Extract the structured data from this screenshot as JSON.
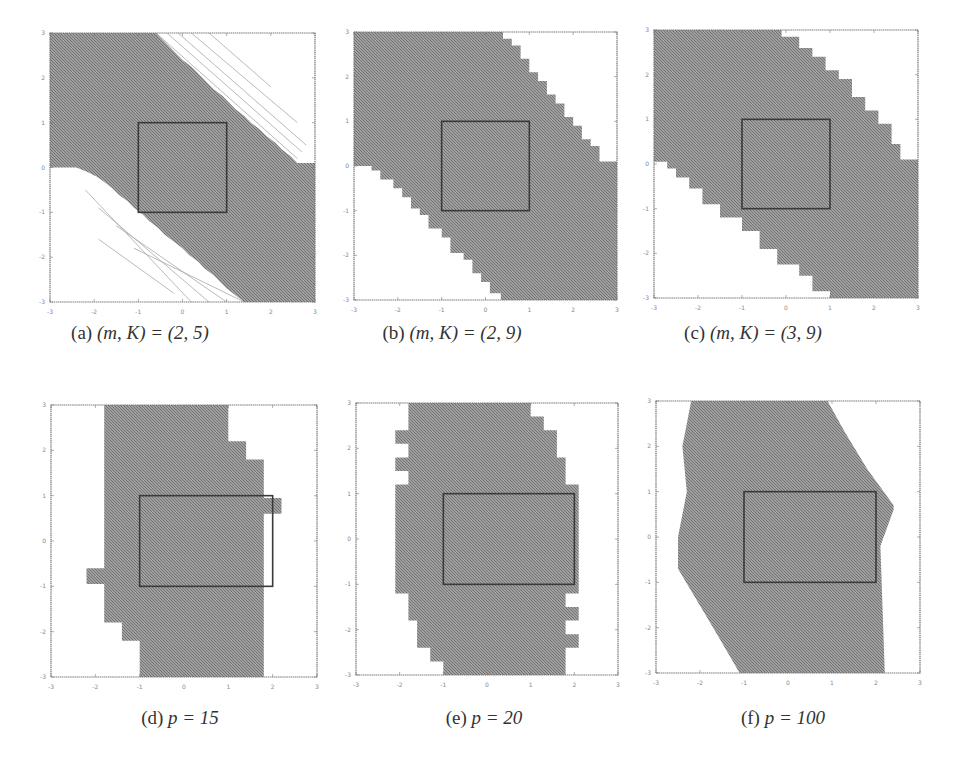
{
  "figure": {
    "panels": [
      {
        "id": "a",
        "caption_label": "(a)",
        "caption_math": "(m, K) = (2, 5)",
        "plot_box_px": [
          50,
          33,
          265,
          269
        ],
        "caption_pos_px": [
          140,
          334
        ],
        "region": [
          [
            -3,
            3
          ],
          [
            -0.6,
            3
          ],
          [
            -0.45,
            2.85
          ],
          [
            -0.3,
            2.7
          ],
          [
            -0.15,
            2.55
          ],
          [
            0,
            2.4
          ],
          [
            0.2,
            2.25
          ],
          [
            0.35,
            2.1
          ],
          [
            0.55,
            1.9
          ],
          [
            0.7,
            1.75
          ],
          [
            0.9,
            1.6
          ],
          [
            1.05,
            1.45
          ],
          [
            1.2,
            1.3
          ],
          [
            1.4,
            1.15
          ],
          [
            1.55,
            1.0
          ],
          [
            1.75,
            0.85
          ],
          [
            1.9,
            0.7
          ],
          [
            2.1,
            0.55
          ],
          [
            2.25,
            0.4
          ],
          [
            2.45,
            0.25
          ],
          [
            2.6,
            0.1
          ],
          [
            3,
            0.1
          ],
          [
            3,
            -3
          ],
          [
            1.4,
            -3
          ],
          [
            1.2,
            -2.85
          ],
          [
            1.0,
            -2.7
          ],
          [
            0.85,
            -2.55
          ],
          [
            0.7,
            -2.4
          ],
          [
            0.5,
            -2.25
          ],
          [
            0.35,
            -2.1
          ],
          [
            0.15,
            -1.95
          ],
          [
            0,
            -1.8
          ],
          [
            -0.2,
            -1.65
          ],
          [
            -0.4,
            -1.5
          ],
          [
            -0.55,
            -1.35
          ],
          [
            -0.75,
            -1.2
          ],
          [
            -0.9,
            -1.05
          ],
          [
            -1.1,
            -0.9
          ],
          [
            -1.25,
            -0.75
          ],
          [
            -1.45,
            -0.6
          ],
          [
            -1.6,
            -0.45
          ],
          [
            -1.8,
            -0.3
          ],
          [
            -1.95,
            -0.2
          ],
          [
            -2.15,
            -0.1
          ],
          [
            -2.4,
            0
          ],
          [
            -3,
            0
          ]
        ],
        "hatch_lines": [
          [
            [
              -0.6,
              3
            ],
            [
              2.6,
              0.2
            ]
          ],
          [
            [
              -0.35,
              3
            ],
            [
              2.7,
              0.35
            ]
          ],
          [
            [
              -0.1,
              3
            ],
            [
              2.8,
              0.5
            ]
          ],
          [
            [
              0.2,
              3
            ],
            [
              2.6,
              1.0
            ]
          ],
          [
            [
              0.6,
              3
            ],
            [
              2.0,
              1.8
            ]
          ],
          [
            [
              -1.1,
              -1.8
            ],
            [
              1.4,
              -3
            ]
          ],
          [
            [
              -1.5,
              -1.3
            ],
            [
              1.0,
              -3
            ]
          ],
          [
            [
              -1.9,
              -0.9
            ],
            [
              0.6,
              -3
            ]
          ],
          [
            [
              -2.2,
              -0.5
            ],
            [
              0.2,
              -3
            ]
          ],
          [
            [
              -1.9,
              -1.6
            ],
            [
              -0.2,
              -2.8
            ]
          ]
        ],
        "box": [
          [
            -1,
            -1
          ],
          [
            1,
            1
          ]
        ]
      },
      {
        "id": "b",
        "caption_label": "(b)",
        "caption_math": "(m, K) = (2, 9)",
        "plot_box_px": [
          354,
          32,
          263,
          268
        ],
        "caption_pos_px": [
          452,
          334
        ],
        "region": [
          [
            -3,
            3
          ],
          [
            0.4,
            3
          ],
          [
            0.4,
            2.85
          ],
          [
            0.6,
            2.85
          ],
          [
            0.6,
            2.7
          ],
          [
            0.8,
            2.7
          ],
          [
            0.8,
            2.4
          ],
          [
            1.0,
            2.4
          ],
          [
            1.0,
            2.1
          ],
          [
            1.2,
            2.1
          ],
          [
            1.2,
            1.9
          ],
          [
            1.4,
            1.9
          ],
          [
            1.4,
            1.6
          ],
          [
            1.6,
            1.6
          ],
          [
            1.6,
            1.4
          ],
          [
            1.8,
            1.4
          ],
          [
            1.8,
            1.1
          ],
          [
            2.0,
            1.1
          ],
          [
            2.0,
            0.9
          ],
          [
            2.2,
            0.9
          ],
          [
            2.2,
            0.6
          ],
          [
            2.4,
            0.6
          ],
          [
            2.4,
            0.45
          ],
          [
            2.6,
            0.45
          ],
          [
            2.6,
            0.1
          ],
          [
            3,
            0.1
          ],
          [
            3,
            -3
          ],
          [
            0.35,
            -3
          ],
          [
            0.35,
            -2.85
          ],
          [
            0.1,
            -2.85
          ],
          [
            0.1,
            -2.6
          ],
          [
            -0.1,
            -2.6
          ],
          [
            -0.1,
            -2.4
          ],
          [
            -0.3,
            -2.4
          ],
          [
            -0.3,
            -2.1
          ],
          [
            -0.5,
            -2.1
          ],
          [
            -0.5,
            -1.95
          ],
          [
            -0.8,
            -1.95
          ],
          [
            -0.8,
            -1.6
          ],
          [
            -1.0,
            -1.6
          ],
          [
            -1.0,
            -1.4
          ],
          [
            -1.3,
            -1.4
          ],
          [
            -1.3,
            -1.1
          ],
          [
            -1.5,
            -1.1
          ],
          [
            -1.5,
            -0.95
          ],
          [
            -1.7,
            -0.95
          ],
          [
            -1.7,
            -0.7
          ],
          [
            -1.9,
            -0.7
          ],
          [
            -1.9,
            -0.5
          ],
          [
            -2.1,
            -0.5
          ],
          [
            -2.1,
            -0.3
          ],
          [
            -2.4,
            -0.3
          ],
          [
            -2.4,
            -0.1
          ],
          [
            -2.6,
            -0.1
          ],
          [
            -2.6,
            0
          ],
          [
            -3,
            0
          ]
        ],
        "hatch_lines": [],
        "box": [
          [
            -1,
            -1
          ],
          [
            1,
            1
          ]
        ]
      },
      {
        "id": "c",
        "caption_label": "(c)",
        "caption_math": "(m, K) = (3, 9)",
        "plot_box_px": [
          654,
          30,
          264,
          268
        ],
        "caption_pos_px": [
          753,
          334
        ],
        "region": [
          [
            -3,
            3
          ],
          [
            -0.1,
            3
          ],
          [
            -0.1,
            2.85
          ],
          [
            0.3,
            2.85
          ],
          [
            0.3,
            2.6
          ],
          [
            0.6,
            2.6
          ],
          [
            0.6,
            2.4
          ],
          [
            0.9,
            2.4
          ],
          [
            0.9,
            2.1
          ],
          [
            1.2,
            2.1
          ],
          [
            1.2,
            1.9
          ],
          [
            1.5,
            1.9
          ],
          [
            1.5,
            1.5
          ],
          [
            1.8,
            1.5
          ],
          [
            1.8,
            1.2
          ],
          [
            2.1,
            1.2
          ],
          [
            2.1,
            0.9
          ],
          [
            2.4,
            0.9
          ],
          [
            2.4,
            0.45
          ],
          [
            2.6,
            0.45
          ],
          [
            2.6,
            0.1
          ],
          [
            3,
            0.1
          ],
          [
            3,
            -3
          ],
          [
            1.0,
            -3
          ],
          [
            1.0,
            -2.85
          ],
          [
            0.6,
            -2.85
          ],
          [
            0.6,
            -2.5
          ],
          [
            0.3,
            -2.5
          ],
          [
            0.3,
            -2.25
          ],
          [
            -0.2,
            -2.25
          ],
          [
            -0.2,
            -1.9
          ],
          [
            -0.6,
            -1.9
          ],
          [
            -0.6,
            -1.5
          ],
          [
            -1.0,
            -1.5
          ],
          [
            -1.0,
            -1.2
          ],
          [
            -1.5,
            -1.2
          ],
          [
            -1.5,
            -0.9
          ],
          [
            -1.9,
            -0.9
          ],
          [
            -1.9,
            -0.55
          ],
          [
            -2.2,
            -0.55
          ],
          [
            -2.2,
            -0.3
          ],
          [
            -2.5,
            -0.3
          ],
          [
            -2.5,
            -0.1
          ],
          [
            -2.7,
            -0.1
          ],
          [
            -2.7,
            0.05
          ],
          [
            -3,
            0.05
          ]
        ],
        "hatch_lines": [],
        "box": [
          [
            -1,
            -1
          ],
          [
            1,
            1
          ]
        ]
      },
      {
        "id": "d",
        "caption_label": "(d)",
        "caption_math": "p = 15",
        "plot_box_px": [
          51,
          405,
          266,
          272
        ],
        "caption_pos_px": [
          180,
          719
        ],
        "region": [
          [
            -1.8,
            3
          ],
          [
            1.0,
            3
          ],
          [
            1.0,
            2.2
          ],
          [
            1.4,
            2.2
          ],
          [
            1.4,
            1.8
          ],
          [
            1.8,
            1.8
          ],
          [
            1.8,
            0.95
          ],
          [
            2.2,
            0.95
          ],
          [
            2.2,
            0.6
          ],
          [
            1.8,
            0.6
          ],
          [
            1.8,
            -3
          ],
          [
            -1.0,
            -3
          ],
          [
            -1.0,
            -2.2
          ],
          [
            -1.4,
            -2.2
          ],
          [
            -1.4,
            -1.8
          ],
          [
            -1.8,
            -1.8
          ],
          [
            -1.8,
            -0.95
          ],
          [
            -2.2,
            -0.95
          ],
          [
            -2.2,
            -0.6
          ],
          [
            -1.8,
            -0.6
          ]
        ],
        "hatch_lines": [],
        "box": [
          [
            -1,
            -1
          ],
          [
            2,
            1
          ]
        ]
      },
      {
        "id": "e",
        "caption_label": "(e)",
        "caption_math": "p = 20",
        "plot_box_px": [
          356,
          403,
          262,
          272
        ],
        "caption_pos_px": [
          484,
          719
        ],
        "region": [
          [
            -1.8,
            3
          ],
          [
            1.0,
            3
          ],
          [
            1.0,
            2.7
          ],
          [
            1.3,
            2.7
          ],
          [
            1.3,
            2.4
          ],
          [
            1.6,
            2.4
          ],
          [
            1.6,
            1.8
          ],
          [
            1.8,
            1.8
          ],
          [
            1.8,
            1.2
          ],
          [
            2.1,
            1.2
          ],
          [
            2.1,
            -1.2
          ],
          [
            1.8,
            -1.2
          ],
          [
            1.8,
            -1.5
          ],
          [
            2.1,
            -1.5
          ],
          [
            2.1,
            -1.8
          ],
          [
            1.8,
            -1.8
          ],
          [
            1.8,
            -2.1
          ],
          [
            2.1,
            -2.1
          ],
          [
            2.1,
            -2.4
          ],
          [
            1.8,
            -2.4
          ],
          [
            1.8,
            -3
          ],
          [
            -1.0,
            -3
          ],
          [
            -1.0,
            -2.7
          ],
          [
            -1.3,
            -2.7
          ],
          [
            -1.3,
            -2.4
          ],
          [
            -1.6,
            -2.4
          ],
          [
            -1.6,
            -1.8
          ],
          [
            -1.8,
            -1.8
          ],
          [
            -1.8,
            -1.2
          ],
          [
            -2.1,
            -1.2
          ],
          [
            -2.1,
            1.2
          ],
          [
            -1.8,
            1.2
          ],
          [
            -1.8,
            1.5
          ],
          [
            -2.1,
            1.5
          ],
          [
            -2.1,
            1.8
          ],
          [
            -1.8,
            1.8
          ],
          [
            -1.8,
            2.1
          ],
          [
            -2.1,
            2.1
          ],
          [
            -2.1,
            2.4
          ],
          [
            -1.8,
            2.4
          ]
        ],
        "hatch_lines": [],
        "box": [
          [
            -1,
            -1
          ],
          [
            2,
            1
          ]
        ]
      },
      {
        "id": "f",
        "caption_label": "(f)",
        "caption_math": "p = 100",
        "plot_box_px": [
          656,
          401,
          264,
          272
        ],
        "caption_pos_px": [
          783,
          719
        ],
        "region": [
          [
            -2.2,
            3
          ],
          [
            0.9,
            3
          ],
          [
            1.3,
            2.3
          ],
          [
            1.8,
            1.5
          ],
          [
            2.4,
            0.7
          ],
          [
            2.4,
            0.6
          ],
          [
            2.1,
            -0.2
          ],
          [
            2.2,
            -3
          ],
          [
            -1.1,
            -3
          ],
          [
            -1.7,
            -2.0
          ],
          [
            -2.5,
            -0.7
          ],
          [
            -2.5,
            0
          ],
          [
            -2.3,
            1.0
          ],
          [
            -2.4,
            2.0
          ]
        ],
        "hatch_lines": [],
        "box": [
          [
            -1,
            -1
          ],
          [
            2,
            1
          ]
        ]
      }
    ],
    "axes": {
      "xlim": [
        -3,
        3
      ],
      "ylim": [
        -3,
        3
      ],
      "xticks": [
        "-3",
        "-2",
        "-1",
        "0",
        "1",
        "2",
        "3"
      ],
      "yticks": [
        "-3",
        "-2",
        "-1",
        "0",
        "1",
        "2",
        "3"
      ]
    },
    "colors": {
      "fill": "#8e8e8e",
      "hatch_dark": "#6e6e6e",
      "hatch_light": "#b5b5b5",
      "frame": "#7a7a7a",
      "box": "#3a3a3a",
      "faint_lines": "#a8a8a8"
    }
  },
  "chart_data": [
    {
      "type": "area",
      "title": "(a) (m, K) = (2, 5)",
      "xlabel": "",
      "ylabel": "",
      "xlim": [
        -3,
        3
      ],
      "ylim": [
        -3,
        3
      ],
      "description": "Diagonal band region (shaded) sloping from upper-left to lower-right, with unit box [-1,1]x[-1,1]; faint hatched boundary lines on both edges"
    },
    {
      "type": "area",
      "title": "(b) (m, K) = (2, 9)",
      "xlim": [
        -3,
        3
      ],
      "ylim": [
        -3,
        3
      ],
      "description": "Staircase-edged diagonal band, box [-1,1]x[-1,1]"
    },
    {
      "type": "area",
      "title": "(c) (m, K) = (3, 9)",
      "xlim": [
        -3,
        3
      ],
      "ylim": [
        -3,
        3
      ],
      "description": "Staircase-edged diagonal band, box [-1,1]x[-1,1]"
    },
    {
      "type": "area",
      "title": "(d) p = 15",
      "xlim": [
        -3,
        3
      ],
      "ylim": [
        -3,
        3
      ],
      "description": "Vertical staircase region x≈[-1.8,1.8], box [-1,2]x[-1,1]"
    },
    {
      "type": "area",
      "title": "(e) p = 20",
      "xlim": [
        -3,
        3
      ],
      "ylim": [
        -3,
        3
      ],
      "description": "Rounded staircase region x≈[-2.1,2.1], box [-1,2]x[-1,1]"
    },
    {
      "type": "area",
      "title": "(f) p = 100",
      "xlim": [
        -3,
        3
      ],
      "ylim": [
        -3,
        3
      ],
      "description": "Smooth hexagon-like region, box [-1,2]x[-1,1]"
    }
  ]
}
